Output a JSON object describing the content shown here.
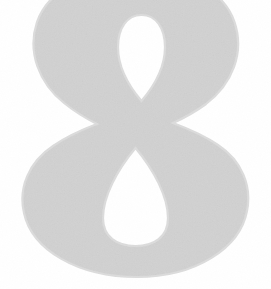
{
  "canvas": {
    "width": 271,
    "height": 289,
    "background_color": "#ffffff"
  },
  "glyph": {
    "character": "8",
    "name": "numeral-eight",
    "style": "didone-serif",
    "fill_color": "#d2d2d2",
    "edge_color": "#dcdcdc",
    "clipped_edges": "top",
    "bounds": {
      "left": 22,
      "top": -14,
      "right": 250,
      "bottom": 277
    },
    "upper_bowl": {
      "left": 38,
      "right": 238,
      "waist_y": 127
    },
    "lower_bowl": {
      "left": 22,
      "right": 250,
      "bottom": 277
    },
    "upper_counter": {
      "shape": "teardrop-down",
      "left": 118,
      "top": 18,
      "right": 165,
      "bottom": 95,
      "fill_color": "#ffffff"
    },
    "lower_counter": {
      "shape": "teardrop-up",
      "left": 103,
      "top": 148,
      "right": 168,
      "bottom": 243,
      "fill_color": "#ffffff"
    }
  },
  "accessibility": {
    "alt_text": "Large light gray numeral 8 on a white background"
  }
}
